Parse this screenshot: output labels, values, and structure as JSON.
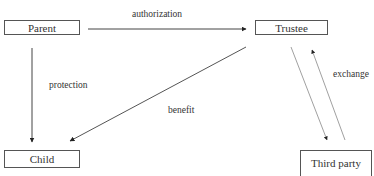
{
  "diagram": {
    "type": "flow",
    "nodes": {
      "parent": {
        "label": "Parent"
      },
      "trustee": {
        "label": "Trustee"
      },
      "child": {
        "label": "Child"
      },
      "third_party": {
        "label": "Third party"
      }
    },
    "edges": [
      {
        "from": "Parent",
        "to": "Trustee",
        "label": "authorization"
      },
      {
        "from": "Parent",
        "to": "Child",
        "label": "protection"
      },
      {
        "from": "Trustee",
        "to": "Child",
        "label": "benefit"
      },
      {
        "from": "Trustee",
        "to": "Third party",
        "label": ""
      },
      {
        "from": "Third party",
        "to": "Trustee",
        "label": "exchange"
      }
    ],
    "edge_labels": {
      "authorization": "authorization",
      "protection": "protection",
      "benefit": "benefit",
      "exchange": "exchange"
    }
  }
}
